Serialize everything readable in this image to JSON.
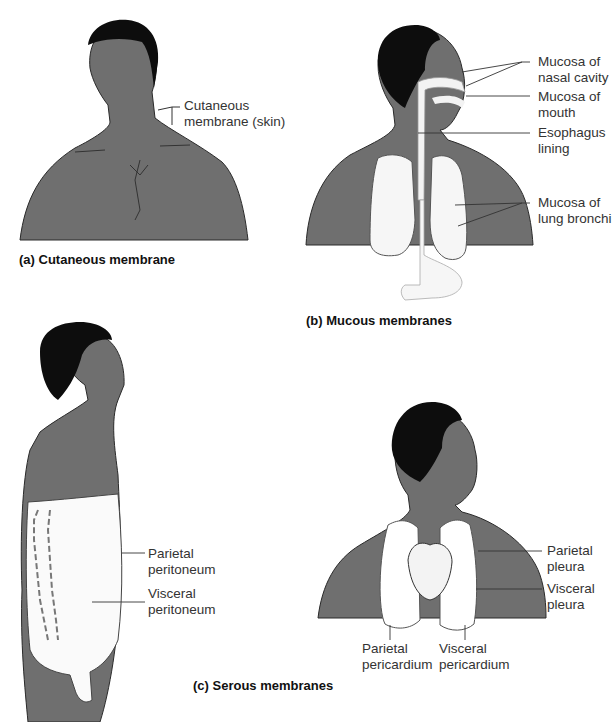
{
  "figure": {
    "panels": [
      {
        "id": "a",
        "caption": "(a) Cutaneous membrane",
        "labels": [
          {
            "line1": "Cutaneous",
            "line2": "membrane (skin)"
          }
        ]
      },
      {
        "id": "b",
        "caption": "(b)  Mucous membranes",
        "labels": [
          {
            "line1": "Mucosa of",
            "line2": "nasal cavity"
          },
          {
            "line1": "Mucosa of",
            "line2": "mouth"
          },
          {
            "line1": "Esophagus",
            "line2": "lining"
          },
          {
            "line1": "Mucosa of",
            "line2": "lung bronchi"
          }
        ]
      },
      {
        "id": "c",
        "caption": "(c)  Serous membranes",
        "labels": [
          {
            "line1": "Parietal",
            "line2": "peritoneum"
          },
          {
            "line1": "Visceral",
            "line2": "peritoneum"
          },
          {
            "line1": "Parietal",
            "line2": "pleura"
          },
          {
            "line1": "Visceral",
            "line2": "pleura"
          },
          {
            "line1": "Parietal",
            "line2": "pericardium"
          },
          {
            "line1": "Visceral",
            "line2": "pericardium"
          }
        ]
      }
    ],
    "colors": {
      "skin": "#6f6f6f",
      "hair": "#0d0d0d",
      "membrane": "#ffffff",
      "outline": "#2a2a2a"
    }
  }
}
